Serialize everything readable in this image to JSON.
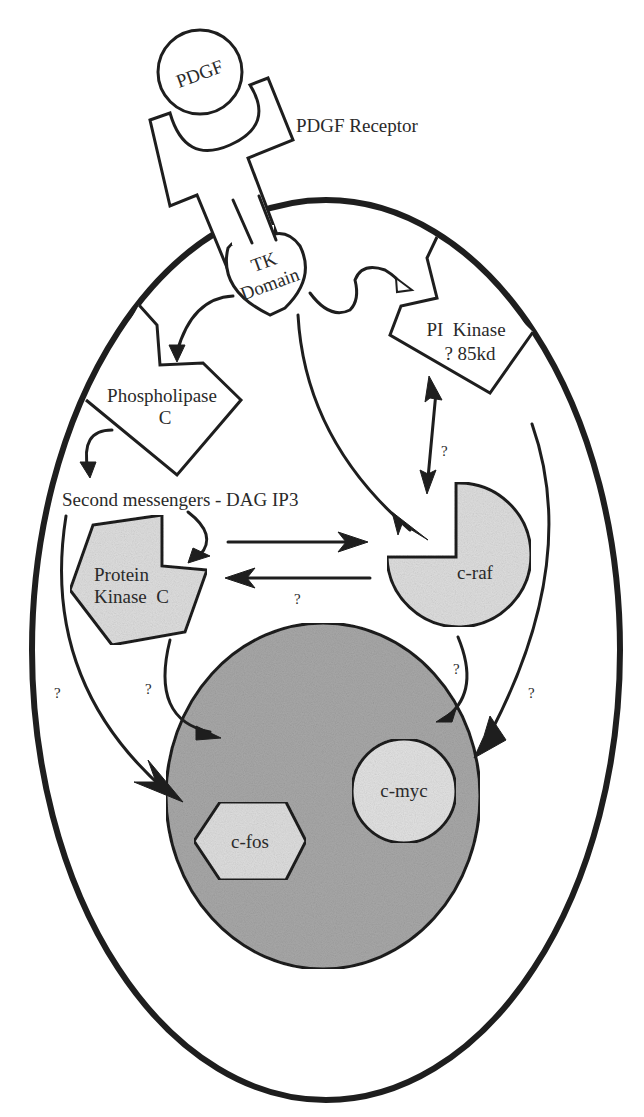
{
  "diagram": {
    "colors": {
      "ink": "#1e1e1e",
      "background": "#ffffff",
      "cytoplasm_protein_fill": "#dedede",
      "nucleus_fill": "#a8a8a8",
      "nuclear_protein_fill": "#e2e2e2"
    },
    "nodes": {
      "pdgf": {
        "label": "PDGF",
        "shape": "circle"
      },
      "receptor": {
        "label": "PDGF Receptor",
        "shape": "receptor"
      },
      "tk_domain": {
        "line1": "TK",
        "line2": "Domain",
        "shape": "heart"
      },
      "pi_kinase": {
        "line1": "PI  Kinase",
        "line2": "? 85kd",
        "shape": "pentagon-notched"
      },
      "phospholipase_c": {
        "line1": "Phospholipase",
        "line2": "C",
        "shape": "pentagon-notched"
      },
      "second_messengers": {
        "label": "Second messengers - DAG IP3",
        "shape": "text"
      },
      "protein_kinase_c": {
        "line1": "Protein",
        "line2": "Kinase  C",
        "shape": "pentagon-notched-shaded"
      },
      "c_raf": {
        "label": "c-raf",
        "shape": "pacman-shaded"
      },
      "nucleus": {
        "label": "",
        "shape": "ellipse-shaded"
      },
      "c_fos": {
        "label": "c-fos",
        "shape": "hexagon"
      },
      "c_myc": {
        "label": "c-myc",
        "shape": "circle"
      }
    },
    "edges": [
      {
        "from": "tk_domain",
        "to": "phospholipase_c",
        "label": ""
      },
      {
        "from": "tk_domain",
        "to": "pi_kinase",
        "label": ""
      },
      {
        "from": "tk_domain",
        "to": "c_raf",
        "label": ""
      },
      {
        "from": "phospholipase_c",
        "to": "second_messengers",
        "label": ""
      },
      {
        "from": "second_messengers",
        "to": "protein_kinase_c",
        "label": ""
      },
      {
        "from": "pi_kinase",
        "to": "c_raf",
        "label": "?",
        "bidirectional": true
      },
      {
        "from": "protein_kinase_c",
        "to": "c_raf",
        "label": ""
      },
      {
        "from": "c_raf",
        "to": "protein_kinase_c",
        "label": "?"
      },
      {
        "from": "second_messengers",
        "to": "c_fos",
        "label": "?"
      },
      {
        "from": "protein_kinase_c",
        "to": "c_fos",
        "label": "?"
      },
      {
        "from": "c_raf",
        "to": "c_myc",
        "label": "?"
      },
      {
        "from": "pi_kinase",
        "to": "c_myc",
        "label": "?"
      }
    ],
    "question_mark": "?"
  }
}
